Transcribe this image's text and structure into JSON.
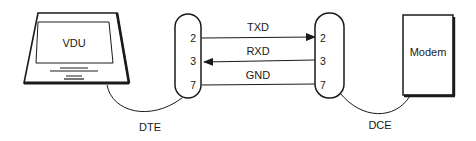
{
  "diagram": {
    "type": "RS-232 serial connection",
    "devices": {
      "terminal": {
        "label": "VDU",
        "role_label": "DTE",
        "icon": "monitor-icon"
      },
      "modem": {
        "label": "Modem",
        "role_label": "DCE",
        "icon": "modem-box"
      }
    },
    "connectors": {
      "dte": {
        "pins": [
          "2",
          "3",
          "7"
        ]
      },
      "dce": {
        "pins": [
          "2",
          "3",
          "7"
        ]
      }
    },
    "signals": [
      {
        "name": "TXD",
        "from_pin": "2",
        "to_pin": "2",
        "direction": "DTE→DCE"
      },
      {
        "name": "RXD",
        "from_pin": "3",
        "to_pin": "3",
        "direction": "DCE→DTE"
      },
      {
        "name": "GND",
        "from_pin": "7",
        "to_pin": "7",
        "direction": "none"
      }
    ],
    "colors": {
      "stroke": "#1a1a1a",
      "background": "#ffffff"
    }
  }
}
